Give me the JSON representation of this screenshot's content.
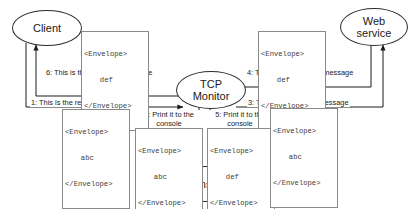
{
  "diagram": {
    "type": "sequence-flow-diagram",
    "nodes": [
      {
        "id": "client",
        "label_lines": [
          "Client"
        ],
        "name": "Client"
      },
      {
        "id": "tcp-monitor",
        "label_lines": [
          "TCP",
          "Monitor"
        ],
        "name": "TCP Monitor"
      },
      {
        "id": "web-service",
        "label_lines": [
          "Web",
          "service"
        ],
        "name": "Web service"
      },
      {
        "id": "console",
        "label_lines": [
          "Console"
        ],
        "name": "Console"
      }
    ],
    "edges": [
      {
        "step": "1",
        "label": "1: This is the request message",
        "from": "client",
        "to": "tcp-monitor"
      },
      {
        "step": "2",
        "label": "2: Print it to the console",
        "from": "tcp-monitor",
        "to": "console"
      },
      {
        "step": "3",
        "label": "3: This is the request message",
        "from": "tcp-monitor",
        "to": "web-service"
      },
      {
        "step": "4",
        "label": "4: This is the response message",
        "from": "web-service",
        "to": "tcp-monitor"
      },
      {
        "step": "5",
        "label": "5: Print it to the console",
        "from": "tcp-monitor",
        "to": "console"
      },
      {
        "step": "6",
        "label": "6: This is the response message",
        "from": "tcp-monitor",
        "to": "client"
      }
    ],
    "envelopes": [
      {
        "id": "env-6",
        "for_step": "6",
        "open_tag": "<Envelope>",
        "body": "def",
        "close_tag": "</Envelope>"
      },
      {
        "id": "env-4",
        "for_step": "4",
        "open_tag": "<Envelope>",
        "body": "def",
        "close_tag": "</Envelope>"
      },
      {
        "id": "env-1",
        "for_step": "1",
        "open_tag": "<Envelope>",
        "body": "abc",
        "close_tag": "</Envelope>"
      },
      {
        "id": "env-2",
        "for_step": "2",
        "open_tag": "<Envelope>",
        "body": "abc",
        "close_tag": "</Envelope>"
      },
      {
        "id": "env-5",
        "for_step": "5",
        "open_tag": "<Envelope>",
        "body": "def",
        "close_tag": "</Envelope>"
      },
      {
        "id": "env-3",
        "for_step": "3",
        "open_tag": "<Envelope>",
        "body": "abc",
        "close_tag": "</Envelope>"
      }
    ],
    "colors": {
      "stroke": "#2b2b2b",
      "box_border": "#8a8a8a",
      "text": "#1a1a1a",
      "code_text": "#3c3c3c",
      "background": "#ffffff"
    }
  }
}
